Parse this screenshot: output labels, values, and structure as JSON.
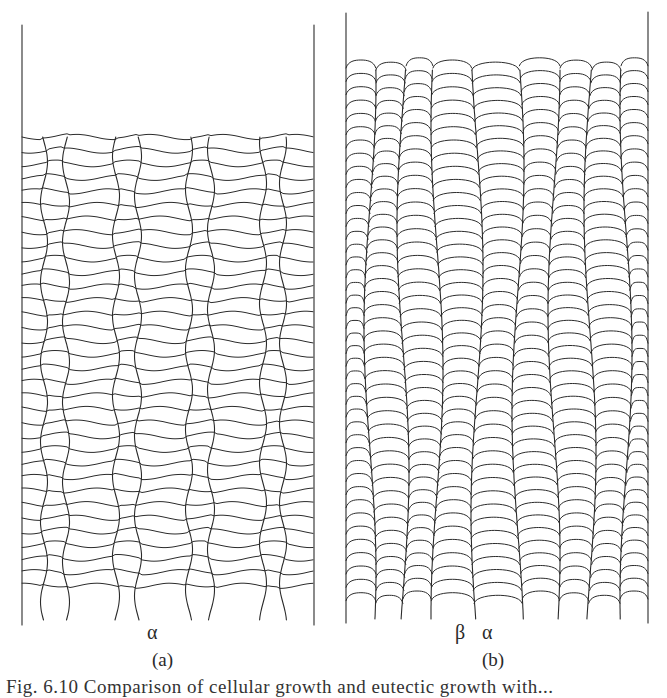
{
  "figure": {
    "panels": [
      {
        "id": "a",
        "label": "(a)",
        "phase_labels": [
          {
            "text": "α",
            "x": 147,
            "y": 622
          }
        ],
        "label_pos": {
          "x": 152,
          "y": 650
        },
        "walls": {
          "left_x": 22,
          "right_x": 314,
          "top_y_left": 25,
          "top_y_right": 25,
          "bottom_y": 625
        },
        "front_y": 137,
        "row_spacing": 13.6,
        "rows_end_y": 596,
        "style": "lamellar-necked",
        "columns": [
          {
            "cx": 55,
            "w": 22
          },
          {
            "cx": 127,
            "w": 22
          },
          {
            "cx": 200,
            "w": 22
          },
          {
            "cx": 273,
            "w": 20
          }
        ]
      },
      {
        "id": "b",
        "label": "(b)",
        "phase_labels": [
          {
            "text": "β",
            "x": 455,
            "y": 622
          },
          {
            "text": "α",
            "x": 482,
            "y": 622
          }
        ],
        "label_pos": {
          "x": 482,
          "y": 650
        },
        "walls": {
          "left_x": 346,
          "right_x": 648,
          "top_y_left": 13,
          "top_y_right": 12,
          "bottom_y": 623
        },
        "front_y": 62,
        "row_spacing": 13.0,
        "rows_end_y": 600,
        "style": "cellular-domed",
        "boundaries": [
          346,
          370,
          403,
          437,
          477,
          518,
          554,
          590,
          626,
          648
        ]
      }
    ],
    "caption_fragment": "Fig. 6.10  Comparison of cellular growth and eutectic growth with..."
  }
}
